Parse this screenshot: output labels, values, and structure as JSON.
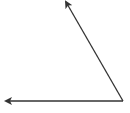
{
  "diagram": {
    "type": "angle",
    "stroke_color": "#333333",
    "background": "#ffffff",
    "vertex": {
      "x": 123,
      "y": 101
    },
    "rays": [
      {
        "name": "horizontal-ray",
        "tip": {
          "x": 6,
          "y": 101
        }
      },
      {
        "name": "slanted-ray",
        "tip": {
          "x": 66,
          "y": 2
        }
      }
    ]
  }
}
